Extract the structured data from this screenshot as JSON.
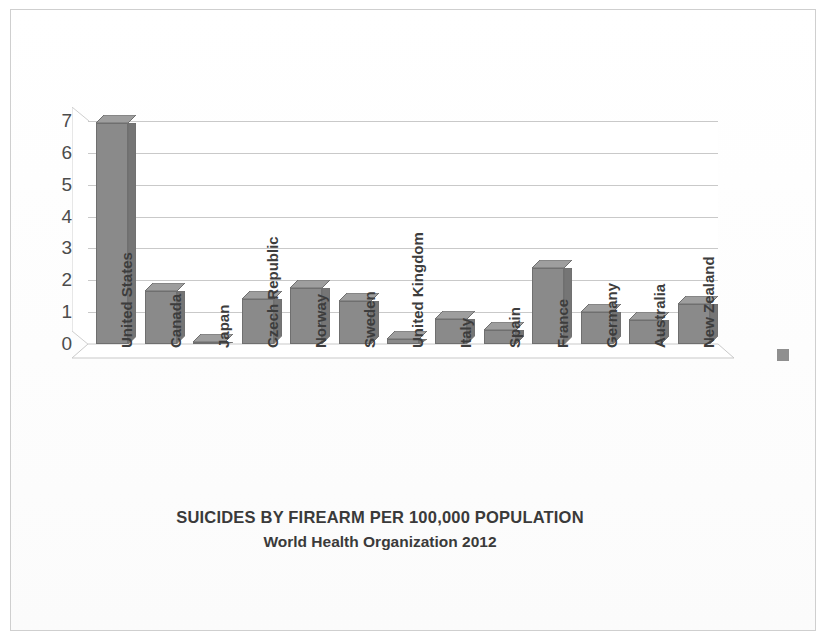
{
  "document": {
    "kind": "scanned-bar-chart",
    "border_color": "#cfcfcf"
  },
  "chart_data": {
    "type": "bar",
    "title": "SUICIDES BY FIREARM PER 100,000 POPULATION",
    "subtitle": "World Health Organization 2012",
    "xlabel": "",
    "ylabel": "",
    "ylim": [
      0,
      7
    ],
    "yticks": [
      7,
      6,
      5,
      4,
      3,
      2,
      1,
      0
    ],
    "ytick_labels": [
      "7",
      "6",
      "5",
      "4",
      "3",
      "2",
      "1",
      "0"
    ],
    "grid": true,
    "grid_axis": "y",
    "legend": false,
    "style": "3d-column",
    "bar_color": "#8a8a8a",
    "bar_edge_color": "#6f6f6f",
    "gridline_color": "#c9c9c9",
    "categories": [
      "United States",
      "Canada",
      "Japan",
      "Czech Republic",
      "Norway",
      "Sweden",
      "United Kingdom",
      "Italy",
      "Spain",
      "France",
      "Germany",
      "Australia",
      "New Zealand"
    ],
    "values": [
      6.95,
      1.65,
      0.04,
      1.4,
      1.75,
      1.35,
      0.17,
      0.77,
      0.44,
      2.4,
      1.0,
      0.75,
      1.25
    ]
  },
  "annotations": {
    "legend_marker_color": "#8f8f8f"
  }
}
